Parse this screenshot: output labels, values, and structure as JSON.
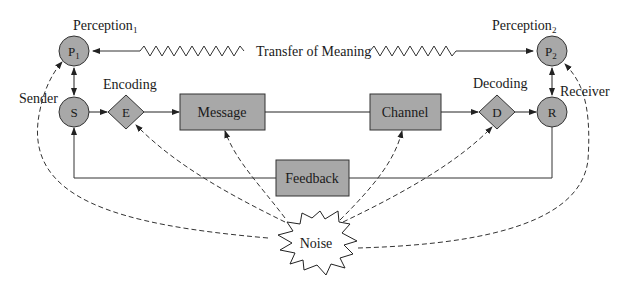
{
  "diagram": {
    "labels": {
      "perception1": "Perception",
      "perception1_sub": "1",
      "perception2": "Perception",
      "perception2_sub": "2",
      "transfer": "Transfer of Meaning",
      "sender": "Sender",
      "receiver": "Receiver",
      "encoding": "Encoding",
      "decoding": "Decoding"
    },
    "nodes": {
      "p1": "P",
      "p1_sub": "1",
      "p2": "P",
      "p2_sub": "2",
      "s": "S",
      "r": "R",
      "e": "E",
      "d": "D",
      "message": "Message",
      "channel": "Channel",
      "feedback": "Feedback",
      "noise": "Noise"
    },
    "colors": {
      "fill": "#a8a8a8",
      "stroke": "#333333",
      "background": "#ffffff"
    }
  }
}
